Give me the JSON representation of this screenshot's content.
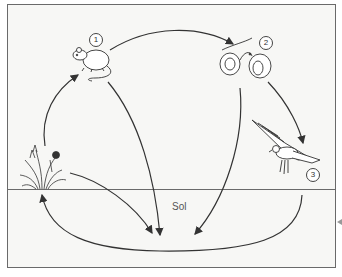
{
  "diagram": {
    "title": "",
    "soil_label": "Sol",
    "organisms": [
      {
        "id": "mouse",
        "number": "1",
        "name": "mouse-icon"
      },
      {
        "id": "snake",
        "number": "2",
        "name": "snake-icon"
      },
      {
        "id": "eagle",
        "number": "3",
        "name": "eagle-icon"
      },
      {
        "id": "plant",
        "number": "",
        "name": "plant-icon"
      }
    ],
    "arrows": [
      {
        "from": "mouse",
        "to": "snake"
      },
      {
        "from": "snake",
        "to": "eagle"
      },
      {
        "from": "plant",
        "to": "mouse"
      },
      {
        "from": "mouse",
        "to": "soil"
      },
      {
        "from": "snake",
        "to": "soil"
      },
      {
        "from": "plant",
        "to": "soil"
      },
      {
        "from": "eagle",
        "to": "soil"
      },
      {
        "from": "soil",
        "to": "plant"
      }
    ],
    "colors": {
      "line": "#333333",
      "frame": "#6a6a6a",
      "background": "#f7f7f5"
    }
  }
}
